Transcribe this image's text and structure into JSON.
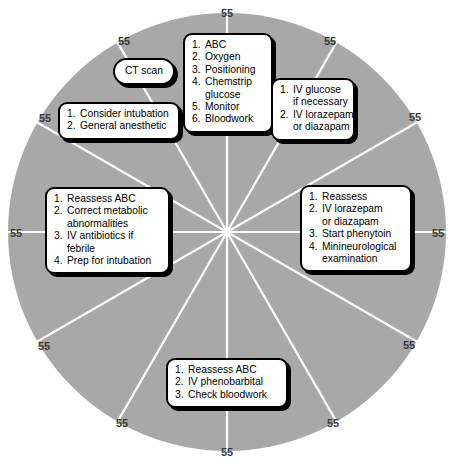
{
  "figure": {
    "wheel": {
      "center_x": 227,
      "center_y": 232,
      "radius": 219,
      "fill_color": "#a8a8a8",
      "spoke_color": "#ffffff",
      "spoke_count": 12,
      "background_color": "#ffffff"
    },
    "ring_labels": [
      {
        "text": "55",
        "angle_deg": 270,
        "x": 227,
        "y": 13
      },
      {
        "text": "55",
        "angle_deg": 300,
        "x": 330,
        "y": 41
      },
      {
        "text": "55",
        "angle_deg": 330,
        "x": 415,
        "y": 117
      },
      {
        "text": "55",
        "angle_deg": 0,
        "x": 438,
        "y": 233
      },
      {
        "text": "55",
        "angle_deg": 30,
        "x": 409,
        "y": 345
      },
      {
        "text": "55",
        "angle_deg": 60,
        "x": 333,
        "y": 423
      },
      {
        "text": "55",
        "angle_deg": 90,
        "x": 227,
        "y": 452
      },
      {
        "text": "55",
        "angle_deg": 120,
        "x": 122,
        "y": 423
      },
      {
        "text": "55",
        "angle_deg": 150,
        "x": 44,
        "y": 346
      },
      {
        "text": "55",
        "angle_deg": 180,
        "x": 16,
        "y": 233
      },
      {
        "text": "55",
        "angle_deg": 210,
        "x": 45,
        "y": 118
      },
      {
        "text": "55",
        "angle_deg": 240,
        "x": 124,
        "y": 41
      }
    ]
  },
  "chart_data": {
    "type": "pie",
    "categories": [
      "55",
      "55",
      "55",
      "55",
      "55",
      "55",
      "55",
      "55",
      "55",
      "55",
      "55",
      "55"
    ],
    "values": [
      55,
      55,
      55,
      55,
      55,
      55,
      55,
      55,
      55,
      55,
      55,
      55
    ],
    "labels": [
      "55",
      "55",
      "55",
      "55",
      "55",
      "55",
      "55",
      "55",
      "55",
      "55",
      "55",
      "55"
    ],
    "xlabel": "",
    "ylabel": "",
    "legend": [],
    "grid": false,
    "legend_position": "none",
    "slice_color": "#a8a8a8",
    "divider_color": "#ffffff",
    "annotations": [
      "1. ABC / 2. Oxygen / 3. Positioning / 4. Chemstrip glucose / 5. Monitor / 6. Bloodwork",
      "1. IV glucose if necessary / 2. IV lorazepam or diazapam",
      "1. Reassess / 2. IV lorazepam or diazapam / 3. Start phenytoin / 4. Minineurological examination",
      "1. Reassess ABC / 2. IV phenobarbital / 3. Check bloodwork",
      "1. Reassess ABC / 2. Correct metabolic abnormalities / 3. IV antibiotics if febrile / 4. Prep for intubation",
      "1. Consider intubation / 2. General anesthetic",
      "CT scan"
    ]
  },
  "callouts": {
    "initial": {
      "name": "initial-assessment",
      "items": [
        {
          "num": "1.",
          "text": "ABC"
        },
        {
          "num": "2.",
          "text": "Oxygen"
        },
        {
          "num": "3.",
          "text": "Positioning"
        },
        {
          "num": "4.",
          "text": "Chemstrip",
          "cont": "glucose"
        },
        {
          "num": "5.",
          "text": "Monitor"
        },
        {
          "num": "6.",
          "text": "Bloodwork"
        }
      ]
    },
    "glucose": {
      "name": "glucose-benzodiazepine",
      "items": [
        {
          "num": "1.",
          "text": "IV glucose",
          "cont": "if necessary"
        },
        {
          "num": "2.",
          "text": "IV lorazepam",
          "cont": "or diazapam"
        }
      ]
    },
    "phenytoin": {
      "name": "reassess-phenytoin",
      "items": [
        {
          "num": "1.",
          "text": "Reassess"
        },
        {
          "num": "2.",
          "text": "IV lorazepam",
          "cont": "or diazapam"
        },
        {
          "num": "3.",
          "text": "Start phenytoin"
        },
        {
          "num": "4.",
          "text": "Minineurological",
          "cont": "examination"
        }
      ]
    },
    "phenobarb": {
      "name": "reassess-phenobarbital",
      "items": [
        {
          "num": "1.",
          "text": "Reassess ABC"
        },
        {
          "num": "2.",
          "text": "IV phenobarbital"
        },
        {
          "num": "3.",
          "text": "Check bloodwork"
        }
      ]
    },
    "metabolic": {
      "name": "metabolic-correction",
      "items": [
        {
          "num": "1.",
          "text": "Reassess ABC"
        },
        {
          "num": "2.",
          "text": "Correct metabolic",
          "cont": "abnormalities"
        },
        {
          "num": "3.",
          "text": "IV antibiotics if",
          "cont": "febrile"
        },
        {
          "num": "4.",
          "text": "Prep for intubation"
        }
      ]
    },
    "intubation": {
      "name": "intubation-anesthetic",
      "items": [
        {
          "num": "1.",
          "text": "Consider intubation"
        },
        {
          "num": "2.",
          "text": "General anesthetic"
        }
      ]
    },
    "ct": {
      "name": "ct-scan",
      "label": "CT scan"
    }
  }
}
